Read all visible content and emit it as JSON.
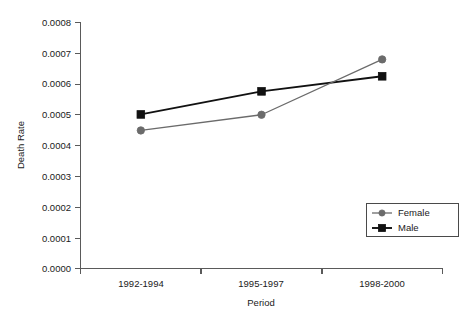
{
  "chart_data": {
    "type": "line",
    "title": "",
    "xlabel": "Period",
    "ylabel": "Death Rate",
    "categories": [
      "1992-1994",
      "1995-1997",
      "1998-2000"
    ],
    "ylim": [
      0.0,
      0.0008
    ],
    "yticks": [
      "0.0000",
      "0.0001",
      "0.0002",
      "0.0003",
      "0.0004",
      "0.0005",
      "0.0006",
      "0.0007",
      "0.0008"
    ],
    "ytick_values": [
      0.0,
      0.0001,
      0.0002,
      0.0003,
      0.0004,
      0.0005,
      0.0006,
      0.0007,
      0.0008
    ],
    "grid": false,
    "legend_position": "lower-right",
    "series": [
      {
        "name": "Female",
        "values": [
          0.000449,
          0.0005,
          0.00068
        ],
        "color": "#6b6b6b",
        "marker": "circle"
      },
      {
        "name": "Male",
        "values": [
          0.000501,
          0.000576,
          0.000625
        ],
        "color": "#111111",
        "marker": "square"
      }
    ]
  },
  "legend": {
    "entries": [
      {
        "label": "Female",
        "marker": "circle-marker",
        "color": "#6b6b6b"
      },
      {
        "label": "Male",
        "marker": "square-marker",
        "color": "#111111"
      }
    ]
  },
  "axes": {
    "y_title": "Death Rate",
    "x_title": "Period"
  }
}
